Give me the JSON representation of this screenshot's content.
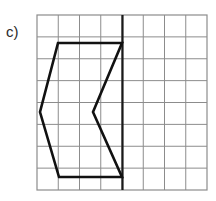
{
  "figure": {
    "label": "c)",
    "background_color": "#ffffff"
  },
  "grid": {
    "columns": 8,
    "rows": 8,
    "x_left": 37,
    "y_top": 15,
    "x_right": 207,
    "y_bottom": 190,
    "cell_width": 21.25,
    "cell_height": 21.875,
    "line_color": "#8c8c8c",
    "line_width": 1,
    "border_color": "#8c8c8c",
    "border_width": 1.2
  },
  "mirror_line": {
    "name": "axis-of-symmetry",
    "orientation": "vertical",
    "x": 122.5,
    "y_start": 15,
    "y_end": 190,
    "color": "#1a1a1a",
    "line_width": 2.2,
    "grid_column_index": 4
  },
  "shape": {
    "name": "arrow-polygon",
    "stroke_color": "#111111",
    "stroke_width": 2.6,
    "fill": "none",
    "closed": true,
    "vertices": [
      {
        "x": 58,
        "y": 43
      },
      {
        "x": 122,
        "y": 43
      },
      {
        "x": 93,
        "y": 112
      },
      {
        "x": 122,
        "y": 177
      },
      {
        "x": 59,
        "y": 177
      },
      {
        "x": 40,
        "y": 112
      }
    ],
    "vertices_grid_units": [
      {
        "col": 1.0,
        "row": 1.3
      },
      {
        "col": 4.0,
        "row": 1.3
      },
      {
        "col": 2.6,
        "row": 4.4
      },
      {
        "col": 4.0,
        "row": 7.4
      },
      {
        "col": 1.0,
        "row": 7.4
      },
      {
        "col": 0.14,
        "row": 4.4
      }
    ]
  }
}
